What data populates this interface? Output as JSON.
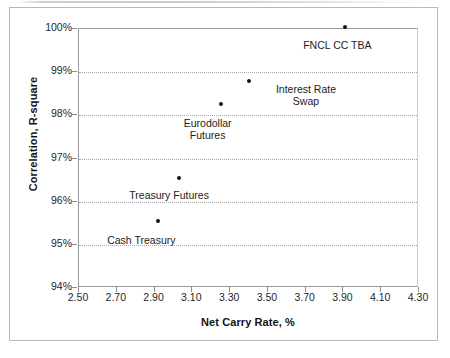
{
  "chart_data": {
    "type": "scatter",
    "title": "",
    "xlabel": "Net Carry Rate, %",
    "ylabel": "Correlation, R-square",
    "xlim": [
      2.5,
      4.3
    ],
    "ylim": [
      94,
      100
    ],
    "xticks": [
      "2.50",
      "2.70",
      "2.90",
      "3.10",
      "3.30",
      "3.50",
      "3.70",
      "3.90",
      "4.10",
      "4.30"
    ],
    "xtick_values": [
      2.5,
      2.7,
      2.9,
      3.1,
      3.3,
      3.5,
      3.7,
      3.9,
      4.1,
      4.3
    ],
    "yticks": [
      "94%",
      "95%",
      "96%",
      "97%",
      "98%",
      "99%",
      "100%"
    ],
    "ytick_values": [
      94,
      95,
      96,
      97,
      98,
      99,
      100
    ],
    "grid": "horizontal-dotted",
    "legend": "none",
    "marker_color": "#151515",
    "points": [
      {
        "label": "Cash Treasury",
        "x": 2.92,
        "y": 95.55,
        "label_align": "center",
        "label_dx": -16,
        "label_dy": 14
      },
      {
        "label": "Treasury Futures",
        "x": 3.03,
        "y": 96.55,
        "label_align": "center",
        "label_dx": -9,
        "label_dy": 12
      },
      {
        "label": "Eurodollar\nFutures",
        "x": 3.25,
        "y": 98.27,
        "label_align": "center",
        "label_dx": -12,
        "label_dy": 14
      },
      {
        "label": "Interest Rate\nSwap",
        "x": 3.4,
        "y": 98.8,
        "label_align": "center",
        "label_dx": 58,
        "label_dy": 3
      },
      {
        "label": "FNCL CC TBA",
        "x": 3.91,
        "y": 100.05,
        "label_align": "center",
        "label_dx": -7,
        "label_dy": 13
      }
    ]
  },
  "axes": {
    "x_title": "Net Carry Rate, %",
    "y_title": "Correlation, R-square"
  }
}
